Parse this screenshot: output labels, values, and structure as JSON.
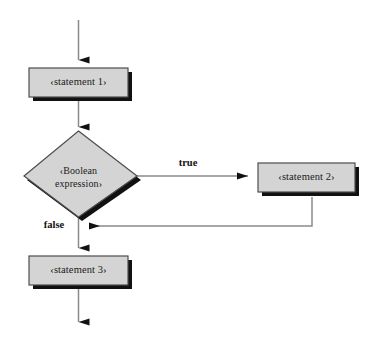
{
  "diagram": {
    "type": "flowchart",
    "background_color": "#ffffff",
    "node_fill_color": "#d4d4d4",
    "node_border_color": "#4d4d4d",
    "shadow_color": "#111111",
    "connector_color": "#8a8a8a",
    "arrowhead_color": "#111111",
    "text_color": "#1a1a1a"
  },
  "nodes": {
    "statement1": {
      "label": "‹statement 1›",
      "shape": "rectangle"
    },
    "condition": {
      "label_line1": "‹Boolean",
      "label_line2": "expression›",
      "shape": "diamond"
    },
    "statement2": {
      "label": "‹statement 2›",
      "shape": "rectangle"
    },
    "statement3": {
      "label": "‹statement 3›",
      "shape": "rectangle"
    }
  },
  "edges": {
    "true_label": "true",
    "false_label": "false"
  }
}
